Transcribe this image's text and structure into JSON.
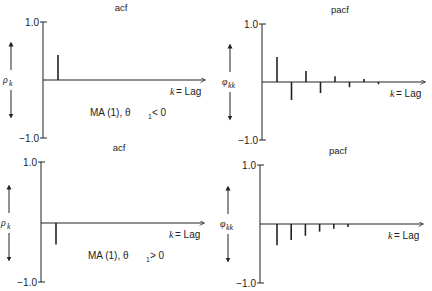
{
  "panels": [
    {
      "id": "acf-ma1-neg",
      "title": "acf",
      "y_label": "ρ",
      "y_label_sub": "k",
      "y_top_tick": "1.0",
      "y_bottom_tick": "−1.0",
      "x_label_var": "k",
      "x_label_rest": " = Lag",
      "annotation_main": "MA (1), θ",
      "annotation_sub": "1",
      "annotation_rel": " < 0",
      "geom": {
        "axis_x": 43,
        "top": 22,
        "bottom": 138,
        "zero": 80,
        "arrow_end": 205,
        "x0": 58,
        "dx": 15
      },
      "values": [
        0.43
      ]
    },
    {
      "id": "pacf-ma1-neg",
      "title": "pacf",
      "y_label": "φ",
      "y_label_sub": "kk",
      "y_top_tick": "1.0",
      "y_bottom_tick": "−1.0",
      "x_label_var": "k",
      "x_label_rest": " = Lag",
      "annotation_main": "",
      "annotation_sub": "",
      "annotation_rel": "",
      "geom": {
        "axis_x": 262,
        "top": 24,
        "bottom": 140,
        "zero": 82,
        "arrow_end": 425,
        "x0": 277,
        "dx": 14.5
      },
      "values": [
        0.43,
        -0.31,
        0.19,
        -0.19,
        0.1,
        -0.09,
        0.05,
        -0.04
      ]
    },
    {
      "id": "acf-ma1-pos",
      "title": "acf",
      "y_label": "ρ",
      "y_label_sub": "k",
      "y_top_tick": "1.0",
      "y_bottom_tick": "−1.0",
      "x_label_var": "k",
      "x_label_rest": " = Lag",
      "annotation_main": "MA (1), θ",
      "annotation_sub": "1",
      "annotation_rel": " > 0",
      "geom": {
        "axis_x": 41,
        "top": 162,
        "bottom": 282,
        "zero": 223,
        "arrow_end": 204,
        "x0": 56,
        "dx": 15
      },
      "values": [
        -0.36
      ]
    },
    {
      "id": "pacf-ma1-pos",
      "title": "pacf",
      "y_label": "φ",
      "y_label_sub": "kk",
      "y_top_tick": "1.0",
      "y_bottom_tick": "−1.0",
      "x_label_var": "k",
      "x_label_rest": " = Lag",
      "annotation_main": "",
      "annotation_sub": "",
      "annotation_rel": "",
      "geom": {
        "axis_x": 260,
        "top": 165,
        "bottom": 283,
        "zero": 224,
        "arrow_end": 423,
        "x0": 277,
        "dx": 14.2
      },
      "values": [
        -0.36,
        -0.27,
        -0.2,
        -0.13,
        -0.08,
        -0.05
      ]
    }
  ],
  "colors": {
    "ink": "#222222",
    "background": "#ffffff"
  }
}
